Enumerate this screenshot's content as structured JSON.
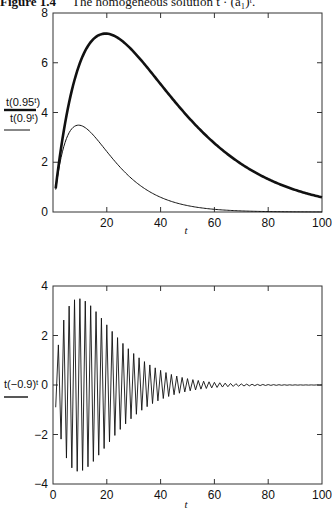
{
  "caption": {
    "figure": "Figure 1.4",
    "text": "The homogeneous solution t · (a₁)ᵗ."
  },
  "chart_data": [
    {
      "type": "line",
      "title": "",
      "xlabel": "t",
      "ylabel": "",
      "xlim": [
        0,
        100
      ],
      "ylim": [
        0,
        8
      ],
      "xticks": [
        0,
        20,
        40,
        60,
        80,
        100
      ],
      "xtick_labels": [
        "",
        "20",
        "40",
        "60",
        "80",
        "100"
      ],
      "yticks": [
        0,
        2,
        4,
        6,
        8
      ],
      "ytick_labels": [
        "0",
        "2",
        "4",
        "6",
        "8"
      ],
      "grid": false,
      "legend_position": "left-outside",
      "series": [
        {
          "name": "t(0.95^t)",
          "formula": "t*0.95^t",
          "line": "thick",
          "x": [
            0,
            5,
            10,
            15,
            20,
            25,
            30,
            40,
            50,
            60,
            70,
            80,
            90,
            100
          ],
          "values": [
            0,
            3.87,
            5.99,
            6.95,
            7.17,
            6.94,
            6.44,
            5.14,
            3.85,
            2.77,
            1.93,
            1.32,
            0.89,
            0.59
          ]
        },
        {
          "name": "t(0.9^t)",
          "formula": "t*0.9^t",
          "line": "thin",
          "x": [
            0,
            5,
            10,
            15,
            20,
            25,
            30,
            40,
            50,
            60,
            70,
            80,
            90,
            100
          ],
          "values": [
            0,
            2.95,
            3.49,
            3.09,
            2.43,
            1.8,
            1.27,
            0.59,
            0.26,
            0.11,
            0.04,
            0.02,
            0.01,
            0.0
          ]
        }
      ]
    },
    {
      "type": "line",
      "title": "",
      "xlabel": "t",
      "ylabel": "",
      "xlim": [
        0,
        100
      ],
      "ylim": [
        -4,
        4
      ],
      "xticks": [
        0,
        20,
        40,
        60,
        80,
        100
      ],
      "xtick_labels": [
        "0",
        "20",
        "40",
        "60",
        "80",
        "100"
      ],
      "yticks": [
        -4,
        -2,
        0,
        2,
        4
      ],
      "ytick_labels": [
        "−4",
        "−2",
        "0",
        "2",
        "4"
      ],
      "grid": false,
      "legend_position": "left-outside",
      "series": [
        {
          "name": "t(−0.9)^t",
          "formula": "t*(-0.9)^t",
          "line": "thin",
          "x": [
            1,
            2,
            3,
            5,
            7,
            9,
            10,
            11,
            13,
            15,
            20,
            25,
            30,
            40,
            50,
            60,
            100
          ],
          "values": [
            -0.9,
            1.62,
            -2.19,
            -2.95,
            -3.35,
            -3.49,
            3.49,
            -3.45,
            -3.3,
            -3.09,
            2.43,
            -1.8,
            1.27,
            0.59,
            0.26,
            0.11,
            0.0
          ]
        }
      ]
    }
  ],
  "legend": {
    "top": [
      {
        "label": "t(0.95ᵗ)",
        "style": "thick"
      },
      {
        "label": "t(0.9ᵗ)",
        "style": "thin"
      }
    ],
    "bottom": [
      {
        "label": "t(−0.9)ᵗ",
        "style": "thin"
      }
    ]
  },
  "colors": {
    "line": "#111111",
    "axis": "#333333",
    "background": "#ffffff"
  }
}
